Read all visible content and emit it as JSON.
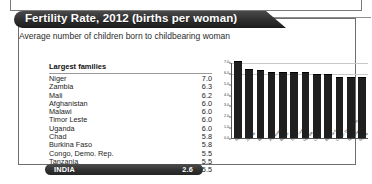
{
  "top_strip": {
    "name": "preceding-panel-edge"
  },
  "card": {
    "title": "Fertility Rate, 2012 (births per woman)",
    "subtitle": "Average number of children born to childbearing woman"
  },
  "table": {
    "header": "Largest families",
    "rows": [
      {
        "country": "Niger",
        "value": "7.0"
      },
      {
        "country": "Zambia",
        "value": "6.3"
      },
      {
        "country": "Mali",
        "value": "6.2"
      },
      {
        "country": "Afghanistan",
        "value": "6.0"
      },
      {
        "country": "Malawi",
        "value": "6.0"
      },
      {
        "country": "Timor Leste",
        "value": "6.0"
      },
      {
        "country": "Uganda",
        "value": "6.0"
      },
      {
        "country": "Chad",
        "value": "5.8"
      },
      {
        "country": "Burkina Faso",
        "value": "5.8"
      },
      {
        "country": "Congo, Demo. Rep.",
        "value": "5.5"
      },
      {
        "country": "Tanzania",
        "value": "5.5"
      },
      {
        "country": "Nigeria",
        "value": "5.5"
      }
    ],
    "highlight": {
      "label": "INDIA",
      "value": "2.6"
    }
  },
  "chart_data": {
    "type": "bar",
    "title": "",
    "xlabel": "",
    "ylabel": "",
    "ylim": [
      0.0,
      7.0
    ],
    "grid": true,
    "legend": "none",
    "yticks": [
      "0.0",
      "1.0",
      "2.0",
      "3.0",
      "4.0",
      "5.0",
      "6.0",
      "7.0"
    ],
    "categories": [
      "Niger",
      "Zambia",
      "Mali",
      "Afghanistan",
      "Malawi",
      "Timor Leste",
      "Uganda",
      "Chad",
      "Burkina Faso",
      "Congo, Demo. Rep.",
      "Tanzania",
      "Nigeria"
    ],
    "values": [
      7.0,
      6.3,
      6.2,
      6.0,
      6.0,
      6.0,
      6.0,
      5.8,
      5.8,
      5.5,
      5.5,
      5.5
    ]
  },
  "colors": {
    "bar": "#1f1f1f",
    "ribbon": "#2e2e2e",
    "pill": "#2f2f2f",
    "border": "#6e6e6e",
    "grid": "#c9c9c9"
  }
}
